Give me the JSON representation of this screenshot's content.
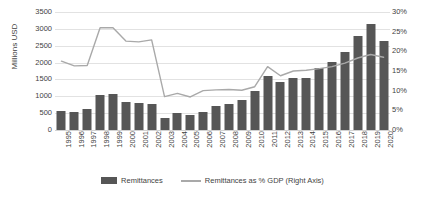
{
  "chart_data": {
    "type": "bar",
    "title": "",
    "xlabel": "",
    "ylabel": "Millions USD",
    "ylabel_right": "",
    "grid": true,
    "legend_position": "bottom",
    "categories": [
      "1995",
      "1996",
      "1997",
      "1998",
      "1999",
      "2000",
      "2001",
      "2002",
      "2003",
      "2004",
      "2005",
      "2006",
      "2007",
      "2008",
      "2009",
      "2010",
      "2011",
      "2012",
      "2013",
      "2014",
      "2015",
      "2016",
      "2017",
      "2018",
      "2019",
      "2020"
    ],
    "ylim": [
      0,
      3500
    ],
    "yticks": [
      "0",
      "500",
      "1000",
      "1500",
      "2000",
      "2500",
      "3000",
      "3500"
    ],
    "ylim_right": [
      0,
      30
    ],
    "yticks_right": [
      "0%",
      "5%",
      "10%",
      "15%",
      "20%",
      "25%",
      "30%"
    ],
    "series": [
      {
        "name": "Remittances",
        "axis": "left",
        "kind": "bar",
        "color": "#565656",
        "values": [
          570,
          540,
          620,
          1050,
          1070,
          830,
          790,
          760,
          350,
          500,
          450,
          530,
          700,
          760,
          900,
          1150,
          1600,
          1430,
          1530,
          1530,
          1830,
          2020,
          2300,
          2800,
          3150,
          2650
        ]
      },
      {
        "name": "Remittances as % GDP (Right Axis)",
        "axis": "right",
        "kind": "line",
        "color": "#a9a9a9",
        "values": [
          17.5,
          16.3,
          16.4,
          26.0,
          26.0,
          22.6,
          22.4,
          22.9,
          8.5,
          9.3,
          8.4,
          10.0,
          10.2,
          10.3,
          10.1,
          11.0,
          16.1,
          13.8,
          15.0,
          15.2,
          15.6,
          16.1,
          17.0,
          18.3,
          19.2,
          18.5
        ]
      }
    ]
  },
  "legend": {
    "items": [
      {
        "label": "Remittances",
        "marker": "bar-swatch"
      },
      {
        "label": "Remittances as % GDP (Right Axis)",
        "marker": "line-swatch"
      }
    ]
  },
  "axis_title": {
    "left": "Millions USD"
  }
}
